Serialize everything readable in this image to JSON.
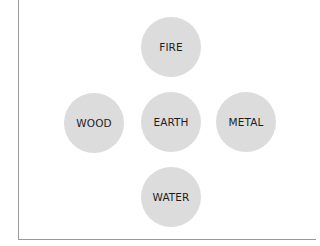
{
  "diagram": {
    "title": "",
    "colors": {
      "circle_fill": "#dcdcdc",
      "text": "#1e1e1e",
      "border": "#9a9a9a"
    },
    "elements": [
      {
        "id": "fire",
        "label": "FIRE",
        "position": "top",
        "cx": 171,
        "cy": 47
      },
      {
        "id": "wood",
        "label": "WOOD",
        "position": "left",
        "cx": 94,
        "cy": 123
      },
      {
        "id": "earth",
        "label": "EARTH",
        "position": "center",
        "cx": 171,
        "cy": 122
      },
      {
        "id": "metal",
        "label": "METAL",
        "position": "right",
        "cx": 246,
        "cy": 122
      },
      {
        "id": "water",
        "label": "WATER",
        "position": "bottom",
        "cx": 171,
        "cy": 197
      }
    ]
  }
}
